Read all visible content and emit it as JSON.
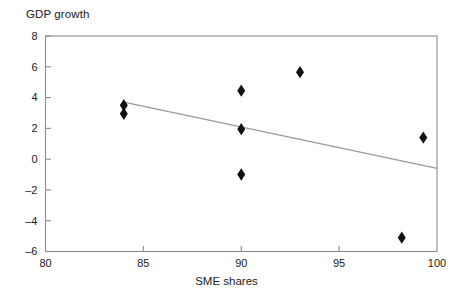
{
  "chart_data": {
    "type": "scatter",
    "title": "GDP growth",
    "xlabel": "SME shares",
    "ylabel": "GDP growth",
    "xlim": [
      80,
      100
    ],
    "ylim": [
      -6,
      8
    ],
    "xticks": [
      80,
      85,
      90,
      95,
      100
    ],
    "yticks": [
      8,
      6,
      4,
      2,
      0,
      -2,
      -4,
      -6
    ],
    "xtick_labels": [
      "80",
      "85",
      "90",
      "95",
      "100"
    ],
    "ytick_labels": [
      "8",
      "6",
      "4",
      "2",
      "0",
      "–2",
      "–4",
      "–6"
    ],
    "grid": false,
    "legend": null,
    "marker": "diamond",
    "marker_color": "#111111",
    "points": [
      {
        "x": 84.0,
        "y": 3.5
      },
      {
        "x": 84.0,
        "y": 2.95
      },
      {
        "x": 90.0,
        "y": 4.45
      },
      {
        "x": 90.0,
        "y": 1.95
      },
      {
        "x": 90.0,
        "y": -1.0
      },
      {
        "x": 93.0,
        "y": 5.65
      },
      {
        "x": 98.2,
        "y": -5.1
      },
      {
        "x": 99.3,
        "y": 1.4
      }
    ],
    "trendline": {
      "type": "linear",
      "color": "#9a9a9a",
      "x_start": 84.0,
      "y_start": 3.7,
      "x_end": 100.0,
      "y_end": -0.6
    }
  },
  "axis": {
    "frame_color": "#8c8c8c",
    "text_color": "#1a1a1a"
  }
}
